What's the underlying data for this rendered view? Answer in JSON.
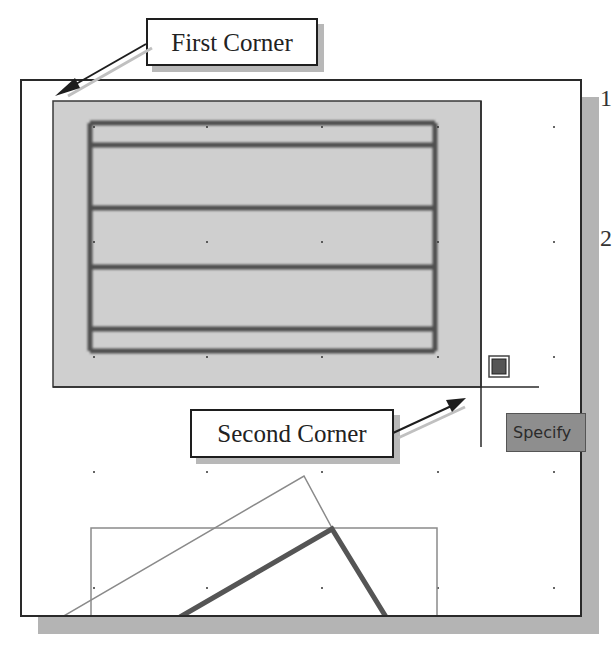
{
  "callouts": {
    "first_corner": "First Corner",
    "second_corner": "Second Corner"
  },
  "tooltip": {
    "text": "Specify"
  },
  "edge_text": {
    "step_1": "1",
    "step_2": "2"
  },
  "colors": {
    "selection_fill": "#cfcfcf",
    "selection_border": "#3a3a3a",
    "object_lines": "#4a4a4a",
    "crosshair": "#2a2a2a",
    "tooltip_bg": "#8e8e8e",
    "shadow": "#b4b4b4"
  },
  "selection_window": {
    "first_corner": [
      51,
      99
    ],
    "second_corner": [
      479,
      385
    ]
  },
  "grid_dots": {
    "x": [
      92,
      205,
      320,
      436,
      552
    ],
    "y": [
      125,
      240,
      355,
      470,
      586
    ]
  }
}
